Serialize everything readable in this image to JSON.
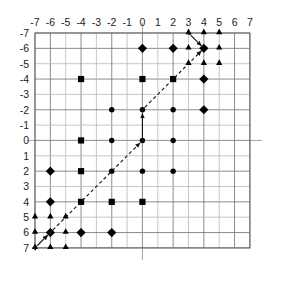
{
  "figure": {
    "title": "",
    "background_color": "#ffffff",
    "marker_color": "#000000",
    "grid_color": "#6f6f6f",
    "frame_color": "#5a5a5a",
    "arrow_color": "#111111"
  },
  "axes": {
    "x_label": "",
    "y_label": "",
    "x_ticks": [
      "-7",
      "-6",
      "-5",
      "-4",
      "-3",
      "-2",
      "-1",
      "0",
      "1",
      "2",
      "3",
      "4",
      "5",
      "6",
      "7"
    ],
    "y_ticks": [
      "-7",
      "-6",
      "-5",
      "-4",
      "-3",
      "-2",
      "-1",
      "0",
      "1",
      "2",
      "3",
      "4",
      "5",
      "6",
      "7"
    ],
    "x_tick_position": "top",
    "y_tick_position": "left",
    "y_axis_inverted": true,
    "xlim": [
      -7,
      7
    ],
    "ylim": [
      -7,
      7
    ],
    "grid": true
  },
  "chart_data": {
    "type": "scatter",
    "title": "",
    "xlabel": "",
    "ylabel": "",
    "xlim": [
      -7,
      7
    ],
    "ylim": [
      -7,
      7
    ],
    "y_inverted": true,
    "grid": true,
    "legend_position": "none",
    "series": [
      {
        "name": "diamond",
        "marker": "diamond",
        "color": "#000000",
        "points": [
          [
            0,
            -6
          ],
          [
            2,
            -6
          ],
          [
            4,
            -6
          ],
          [
            4,
            -4
          ],
          [
            4,
            -2
          ],
          [
            -6,
            2
          ],
          [
            -6,
            4
          ],
          [
            -6,
            6
          ],
          [
            -4,
            6
          ],
          [
            -2,
            6
          ]
        ]
      },
      {
        "name": "square",
        "marker": "square",
        "color": "#000000",
        "points": [
          [
            -4,
            -4
          ],
          [
            0,
            -4
          ],
          [
            2,
            -4
          ],
          [
            -4,
            0
          ],
          [
            -4,
            2
          ],
          [
            -4,
            4
          ],
          [
            -2,
            4
          ],
          [
            0,
            4
          ]
        ]
      },
      {
        "name": "circle",
        "marker": "circle",
        "color": "#000000",
        "points": [
          [
            -2,
            -2
          ],
          [
            0,
            -2
          ],
          [
            2,
            -2
          ],
          [
            -2,
            0
          ],
          [
            0,
            0
          ],
          [
            2,
            0
          ],
          [
            -2,
            2
          ],
          [
            0,
            2
          ],
          [
            2,
            2
          ]
        ]
      },
      {
        "name": "triangle",
        "marker": "triangle",
        "color": "#000000",
        "points": [
          [
            3,
            -7
          ],
          [
            4,
            -7
          ],
          [
            5,
            -7
          ],
          [
            3,
            -6
          ],
          [
            5,
            -6
          ],
          [
            3,
            -5
          ],
          [
            4,
            -5
          ],
          [
            5,
            -5
          ],
          [
            -7,
            5
          ],
          [
            -6,
            5
          ],
          [
            -5,
            5
          ],
          [
            -7,
            6
          ],
          [
            -5,
            6
          ],
          [
            -7,
            7
          ],
          [
            -6,
            7
          ],
          [
            -5,
            7
          ]
        ]
      }
    ],
    "annotations": [
      {
        "name": "arrow-upper-right",
        "type": "double_arrow",
        "from": [
          3,
          -7
        ],
        "to": [
          4,
          -6
        ],
        "style": "solid"
      },
      {
        "name": "arrow-diagonal-upper",
        "type": "double_arrow",
        "from": [
          0,
          -2
        ],
        "to": [
          4,
          -6
        ],
        "style": "dashed"
      },
      {
        "name": "arrow-vertical-center",
        "type": "double_arrow",
        "from": [
          0,
          0
        ],
        "to": [
          0,
          -2
        ],
        "style": "solid"
      },
      {
        "name": "arrow-diagonal-lower",
        "type": "double_arrow",
        "from": [
          -6,
          6
        ],
        "to": [
          0,
          0
        ],
        "style": "dashed"
      },
      {
        "name": "arrow-lower-left",
        "type": "double_arrow",
        "from": [
          -7,
          7
        ],
        "to": [
          -6,
          6
        ],
        "style": "solid"
      }
    ]
  }
}
